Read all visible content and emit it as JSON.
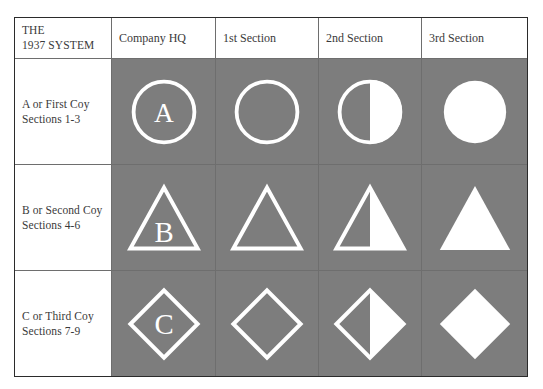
{
  "table": {
    "corner_label_lines": [
      "THE",
      "1937 SYSTEM"
    ],
    "column_headers": [
      {
        "label": "Company HQ"
      },
      {
        "label": "1st Section"
      },
      {
        "label": "2nd Section"
      },
      {
        "label": "3rd Section"
      }
    ],
    "rows": [
      {
        "label_lines": [
          "A or First Coy",
          "Sections 1-3"
        ],
        "shape": "circle",
        "letter": "A",
        "cells": [
          {
            "name": "circle-outline-with-letter-a",
            "style": "outline-letter"
          },
          {
            "name": "circle-outline",
            "style": "outline"
          },
          {
            "name": "circle-half-filled",
            "style": "half"
          },
          {
            "name": "circle-filled",
            "style": "solid"
          }
        ]
      },
      {
        "label_lines": [
          "B or Second Coy",
          "Sections 4-6"
        ],
        "shape": "triangle",
        "letter": "B",
        "cells": [
          {
            "name": "triangle-outline-with-letter-b",
            "style": "outline-letter"
          },
          {
            "name": "triangle-outline",
            "style": "outline"
          },
          {
            "name": "triangle-half-filled",
            "style": "half"
          },
          {
            "name": "triangle-filled",
            "style": "solid"
          }
        ]
      },
      {
        "label_lines": [
          "C or Third Coy",
          "Sections 7-9"
        ],
        "shape": "diamond",
        "letter": "C",
        "cells": [
          {
            "name": "diamond-outline-with-letter-c",
            "style": "outline-letter"
          },
          {
            "name": "diamond-outline",
            "style": "outline"
          },
          {
            "name": "diamond-half-filled",
            "style": "half"
          },
          {
            "name": "diamond-filled",
            "style": "solid"
          }
        ]
      }
    ]
  },
  "colors": {
    "symbol_cell_background": "#7d7d7d",
    "symbol_stroke": "#ffffff",
    "table_border": "#2b2b2b",
    "inner_rule": "#6e6e6e",
    "page_background": "#ffffff",
    "text": "#3a3a3a"
  }
}
